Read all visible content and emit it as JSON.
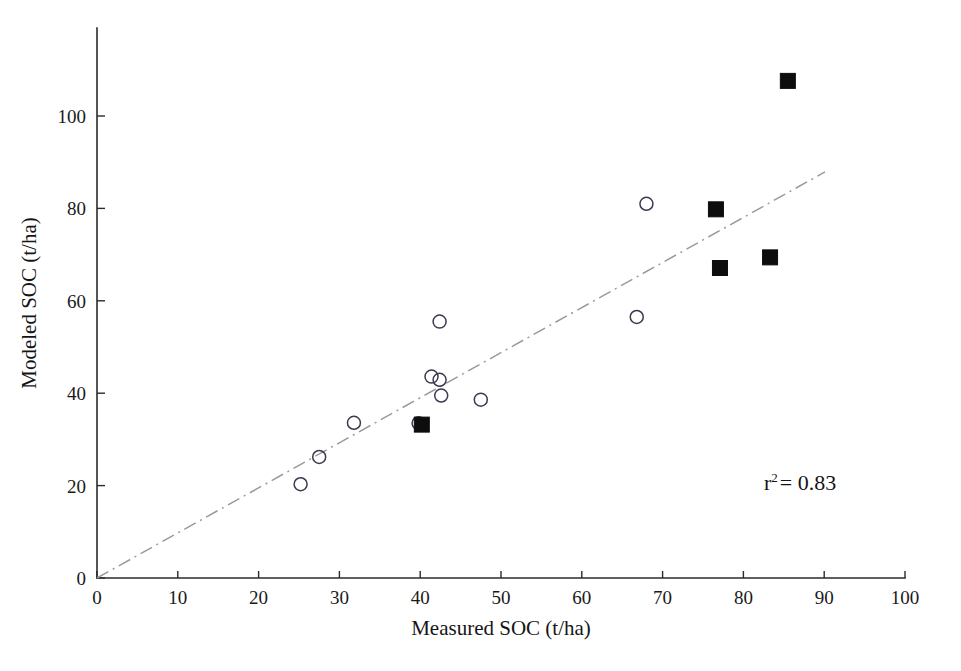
{
  "chart_data": {
    "type": "scatter",
    "title": "",
    "xlabel": "Measured SOC (t/ha)",
    "ylabel": "Modeled SOC (t/ha)",
    "xlim": [
      0,
      100
    ],
    "ylim": [
      0,
      115
    ],
    "xticks": [
      0,
      10,
      20,
      30,
      40,
      50,
      60,
      70,
      80,
      90,
      100
    ],
    "xticklabels": [
      "0",
      "10",
      "20",
      "30",
      "40",
      "50",
      "60",
      "70",
      "80",
      "90",
      "100"
    ],
    "yticks": [
      0,
      20,
      40,
      60,
      80,
      100
    ],
    "yticklabels": [
      "0",
      "20",
      "40",
      "60",
      "80",
      "100"
    ],
    "grid": false,
    "legend": "none",
    "annotations": [
      {
        "name": "r-squared",
        "text_prefix": "r",
        "text_superscript": "2",
        "text_suffix": "= 0.83",
        "full_text": "r2 = 0.83",
        "value": 0.83,
        "x": 80,
        "y": 22
      }
    ],
    "series": [
      {
        "name": "open-circles",
        "marker": "open-circle",
        "color": "#3a3a50",
        "points": [
          {
            "x": 25.2,
            "y": 20.3
          },
          {
            "x": 27.5,
            "y": 26.2
          },
          {
            "x": 31.8,
            "y": 33.6
          },
          {
            "x": 39.8,
            "y": 33.5
          },
          {
            "x": 41.4,
            "y": 43.6
          },
          {
            "x": 42.4,
            "y": 42.9
          },
          {
            "x": 42.4,
            "y": 55.5
          },
          {
            "x": 42.6,
            "y": 39.5
          },
          {
            "x": 47.5,
            "y": 38.6
          },
          {
            "x": 66.8,
            "y": 56.5
          },
          {
            "x": 68.0,
            "y": 81.0
          }
        ]
      },
      {
        "name": "filled-squares",
        "marker": "filled-square",
        "color": "#0d0d0d",
        "points": [
          {
            "x": 40.2,
            "y": 33.2
          },
          {
            "x": 76.6,
            "y": 79.8
          },
          {
            "x": 77.1,
            "y": 67.1
          },
          {
            "x": 83.3,
            "y": 69.4
          },
          {
            "x": 85.5,
            "y": 107.6
          }
        ]
      }
    ],
    "trendline": {
      "name": "one-to-one-line",
      "style": "dash-dot",
      "color": "#9a9a9a",
      "x_start": 0,
      "y_start": 0,
      "x_end": 90.1,
      "y_end": 87.9
    }
  }
}
